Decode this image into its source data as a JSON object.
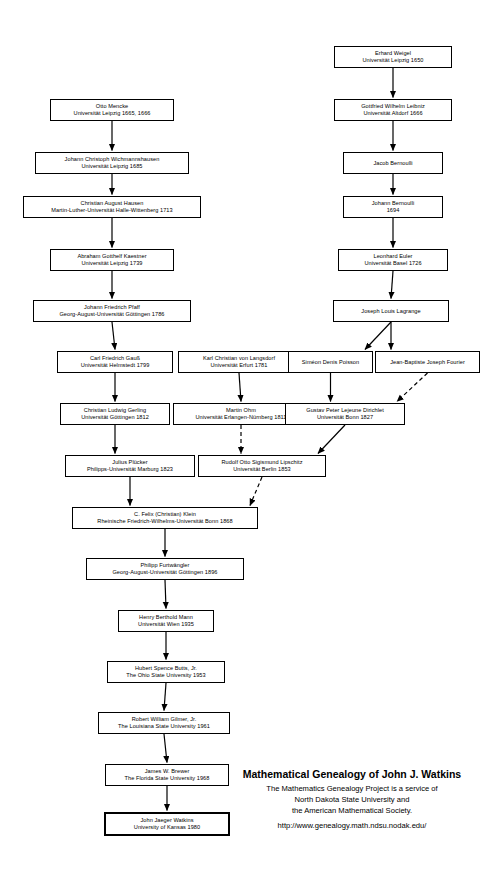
{
  "document": {
    "kind": "mathematics-genealogy-chart"
  },
  "title_block": {
    "heading": "Mathematical Genealogy of John J. Watkins",
    "lines": [
      "The Mathematics Genealogy Project is a service of",
      "North Dakota State University and",
      "the American Mathematical Society."
    ],
    "url": "http://www.genealogy.math.ndsu.nodak.edu/"
  },
  "nodes": [
    {
      "id": "weigel",
      "name": "Erhard Weigel",
      "school": "Universität Leipzig 1650",
      "x": 334,
      "y": 46,
      "w": 118,
      "h": 22,
      "highlight": false
    },
    {
      "id": "mencke",
      "name": "Otto Mencke",
      "school": "Universität Leipzig 1665, 1666",
      "x": 50,
      "y": 99,
      "w": 124,
      "h": 22,
      "highlight": false
    },
    {
      "id": "leibniz",
      "name": "Gottfried Wilhelm Leibniz",
      "school": "Universität Altdorf 1666",
      "x": 334,
      "y": 99,
      "w": 118,
      "h": 22,
      "highlight": false
    },
    {
      "id": "wichmannshausen",
      "name": "Johann Christoph Wichmannshausen",
      "school": "Universität Leipzig 1685",
      "x": 35,
      "y": 152,
      "w": 154,
      "h": 22,
      "highlight": false
    },
    {
      "id": "jacobbernoulli",
      "name": "Jacob Bernoulli",
      "school": "",
      "x": 343,
      "y": 152,
      "w": 100,
      "h": 22,
      "highlight": false
    },
    {
      "id": "hausen",
      "name": "Christian August Hausen",
      "school": "Martin-Luther-Universität Halle-Wittenberg 1713",
      "x": 23,
      "y": 196,
      "w": 178,
      "h": 22,
      "highlight": false
    },
    {
      "id": "johannbernoulli",
      "name": "Johann Bernoulli",
      "school": "1694",
      "x": 343,
      "y": 196,
      "w": 100,
      "h": 22,
      "highlight": false
    },
    {
      "id": "kaestner",
      "name": "Abraham Gotthelf Kaestner",
      "school": "Universität Leipzig 1739",
      "x": 50,
      "y": 249,
      "w": 124,
      "h": 22,
      "highlight": false
    },
    {
      "id": "euler",
      "name": "Leonhard Euler",
      "school": "Universität Basel 1726",
      "x": 338,
      "y": 249,
      "w": 110,
      "h": 22,
      "highlight": false
    },
    {
      "id": "pfaff",
      "name": "Johann Friedrich Pfaff",
      "school": "Georg-August-Universität Göttingen 1786",
      "x": 33,
      "y": 300,
      "w": 158,
      "h": 22,
      "highlight": false
    },
    {
      "id": "lagrange",
      "name": "Joseph Louis Lagrange",
      "school": "",
      "x": 333,
      "y": 300,
      "w": 116,
      "h": 22,
      "highlight": false
    },
    {
      "id": "gauss",
      "name": "Carl Friedrich Gauß",
      "school": "Universität Helmstedt 1799",
      "x": 57,
      "y": 351,
      "w": 116,
      "h": 22,
      "highlight": false
    },
    {
      "id": "langsdorf",
      "name": "Karl Christian von Langsdorf",
      "school": "Universität Erfurt 1781",
      "x": 178,
      "y": 351,
      "w": 122,
      "h": 22,
      "highlight": false
    },
    {
      "id": "poisson",
      "name": "Siméon Denis Poisson",
      "school": "",
      "x": 288,
      "y": 351,
      "w": 85,
      "h": 22,
      "highlight": false
    },
    {
      "id": "fourier",
      "name": "Jean-Baptiste Joseph Fourier",
      "school": "",
      "x": 375,
      "y": 351,
      "w": 105,
      "h": 22,
      "highlight": false
    },
    {
      "id": "gerling",
      "name": "Christian Ludwig Gerling",
      "school": "Universität Göttingen 1812",
      "x": 60,
      "y": 403,
      "w": 110,
      "h": 22,
      "highlight": false
    },
    {
      "id": "ohm",
      "name": "Martin Ohm",
      "school": "Universität Erlangen-Nürnberg 1811",
      "x": 173,
      "y": 403,
      "w": 136,
      "h": 22,
      "highlight": false
    },
    {
      "id": "dirichlet",
      "name": "Gustav Peter Lejeune Dirichlet",
      "school": "Universität Bonn 1827",
      "x": 285,
      "y": 403,
      "w": 120,
      "h": 22,
      "highlight": false
    },
    {
      "id": "plucker",
      "name": "Julius Plücker",
      "school": "Philipps-Universität Marburg 1823",
      "x": 65,
      "y": 455,
      "w": 130,
      "h": 22,
      "highlight": false
    },
    {
      "id": "lipschitz",
      "name": "Rudolf Otto Sigismund Lipschitz",
      "school": "Universität Berlin 1853",
      "x": 198,
      "y": 455,
      "w": 128,
      "h": 22,
      "highlight": false
    },
    {
      "id": "klein",
      "name": "C. Felix (Christian) Klein",
      "school": "Rheinische Friedrich-Wilhelms-Universität Bonn 1868",
      "x": 72,
      "y": 507,
      "w": 186,
      "h": 22,
      "highlight": false
    },
    {
      "id": "furtwangler",
      "name": "Philipp Furtwängler",
      "school": "Georg-August-Universität Göttingen 1896",
      "x": 86,
      "y": 558,
      "w": 158,
      "h": 22,
      "highlight": false
    },
    {
      "id": "mann",
      "name": "Henry Berthold Mann",
      "school": "Universität Wien 1935",
      "x": 118,
      "y": 610,
      "w": 96,
      "h": 22,
      "highlight": false
    },
    {
      "id": "butts",
      "name": "Hubert Spence Butts, Jr.",
      "school": "The Ohio State University 1953",
      "x": 107,
      "y": 661,
      "w": 118,
      "h": 22,
      "highlight": false
    },
    {
      "id": "gilmer",
      "name": "Robert William Gilmer, Jr.",
      "school": "The Louisiana State University 1961",
      "x": 98,
      "y": 712,
      "w": 132,
      "h": 22,
      "highlight": false
    },
    {
      "id": "brewer",
      "name": "James W. Brewer",
      "school": "The Florida State University 1968",
      "x": 105,
      "y": 764,
      "w": 124,
      "h": 22,
      "highlight": false
    },
    {
      "id": "watkins",
      "name": "John Jaeger Watkins",
      "school": "University of Kansas 1980",
      "x": 104,
      "y": 812,
      "w": 126,
      "h": 24,
      "highlight": true
    }
  ],
  "edges": [
    {
      "from": "weigel",
      "to": "leibniz",
      "style": "solid"
    },
    {
      "from": "mencke",
      "to": "wichmannshausen",
      "style": "solid"
    },
    {
      "from": "leibniz",
      "to": "jacobbernoulli",
      "style": "solid"
    },
    {
      "from": "wichmannshausen",
      "to": "hausen",
      "style": "solid"
    },
    {
      "from": "jacobbernoulli",
      "to": "johannbernoulli",
      "style": "solid"
    },
    {
      "from": "hausen",
      "to": "kaestner",
      "style": "solid"
    },
    {
      "from": "johannbernoulli",
      "to": "euler",
      "style": "solid"
    },
    {
      "from": "kaestner",
      "to": "pfaff",
      "style": "solid"
    },
    {
      "from": "euler",
      "to": "lagrange",
      "style": "solid"
    },
    {
      "from": "pfaff",
      "to": "gauss",
      "style": "solid"
    },
    {
      "from": "lagrange",
      "to": "poisson",
      "style": "solid"
    },
    {
      "from": "lagrange",
      "to": "fourier",
      "style": "solid"
    },
    {
      "from": "gauss",
      "to": "gerling",
      "style": "solid"
    },
    {
      "from": "langsdorf",
      "to": "ohm",
      "style": "solid"
    },
    {
      "from": "poisson",
      "to": "dirichlet",
      "style": "solid"
    },
    {
      "from": "fourier",
      "to": "dirichlet",
      "style": "dashed"
    },
    {
      "from": "gerling",
      "to": "plucker",
      "style": "solid"
    },
    {
      "from": "ohm",
      "to": "lipschitz",
      "style": "dashed"
    },
    {
      "from": "dirichlet",
      "to": "lipschitz",
      "style": "solid"
    },
    {
      "from": "plucker",
      "to": "klein",
      "style": "solid"
    },
    {
      "from": "lipschitz",
      "to": "klein",
      "style": "dashed"
    },
    {
      "from": "klein",
      "to": "furtwangler",
      "style": "solid"
    },
    {
      "from": "furtwangler",
      "to": "mann",
      "style": "solid"
    },
    {
      "from": "mann",
      "to": "butts",
      "style": "solid"
    },
    {
      "from": "butts",
      "to": "gilmer",
      "style": "solid"
    },
    {
      "from": "gilmer",
      "to": "brewer",
      "style": "solid"
    },
    {
      "from": "brewer",
      "to": "watkins",
      "style": "solid"
    }
  ],
  "layout": {
    "title_block_x": 214,
    "title_block_y": 768,
    "title_block_width": 276,
    "edge_color": "#000000"
  }
}
